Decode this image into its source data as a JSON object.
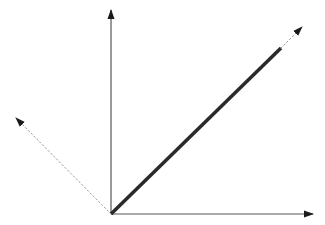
{
  "diagram": {
    "width": 325,
    "height": 225,
    "background": "#ffffff",
    "origin": {
      "x": 111,
      "y": 214
    },
    "colors": {
      "axis": "#555555",
      "thick_vector": "#2a2a2a",
      "dotted": "#999999",
      "arrowhead": "#1a1a1a"
    },
    "elements": [
      {
        "name": "vertical-axis",
        "type": "axis",
        "from": [
          111,
          214
        ],
        "to": [
          111,
          10
        ],
        "style": "solid",
        "width": 1.2,
        "arrow": true
      },
      {
        "name": "horizontal-axis",
        "type": "axis",
        "from": [
          111,
          214
        ],
        "to": [
          313,
          214
        ],
        "style": "solid",
        "width": 1.2,
        "arrow": true
      },
      {
        "name": "thick-vector",
        "type": "vector",
        "from": [
          111,
          214
        ],
        "to": [
          281,
          48
        ],
        "style": "solid",
        "width": 3.5,
        "arrow": false
      },
      {
        "name": "dotted-extension-vector",
        "type": "vector",
        "from": [
          281,
          48
        ],
        "to": [
          302,
          27
        ],
        "style": "dotted",
        "width": 1,
        "arrow": true
      },
      {
        "name": "dotted-left-vector",
        "type": "vector",
        "from": [
          111,
          214
        ],
        "to": [
          16,
          118
        ],
        "style": "dotted",
        "width": 1,
        "arrow": true
      }
    ]
  }
}
